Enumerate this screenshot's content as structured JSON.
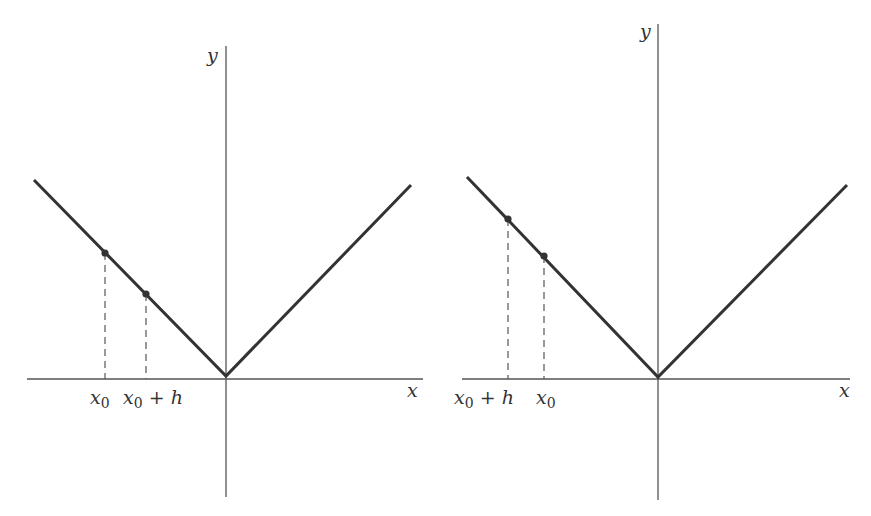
{
  "colors": {
    "background": "#ffffff",
    "axis": "#555555",
    "curve": "#333333",
    "dashed": "#555555",
    "point": "#333333",
    "label": "#333333"
  },
  "panels": [
    {
      "id": "left",
      "axis_labels": {
        "x": "x",
        "y": "y"
      },
      "axes": {
        "x_axis": {
          "x1": 27,
          "x2": 423,
          "y": 379
        },
        "y_axis": {
          "x": 226,
          "y1": 46,
          "y2": 497
        }
      },
      "curve": {
        "left_end": [
          34,
          180
        ],
        "vertex": [
          226,
          376
        ],
        "right_end": [
          411,
          185
        ]
      },
      "points": [
        {
          "name": "x0",
          "x": 105,
          "y": 253,
          "label": "x",
          "sub": "0",
          "label_x": 90,
          "suffix": ""
        },
        {
          "name": "x0-plus-h",
          "x": 146,
          "y": 294,
          "label": "x",
          "sub": "0",
          "label_x": 123,
          "suffix": "+ h"
        }
      ],
      "x_label_pos": [
        407,
        397
      ],
      "y_label_pos": [
        207,
        62
      ]
    },
    {
      "id": "right",
      "axis_labels": {
        "x": "x",
        "y": "y"
      },
      "axes": {
        "x_axis": {
          "x1": 462,
          "x2": 850,
          "y": 379
        },
        "y_axis": {
          "x": 658,
          "y1": 24,
          "y2": 500
        }
      },
      "curve": {
        "left_end": [
          467,
          177
        ],
        "vertex": [
          658,
          377
        ],
        "right_end": [
          847,
          185
        ]
      },
      "points": [
        {
          "name": "x0-plus-h",
          "x": 508,
          "y": 219,
          "label": "x",
          "sub": "0",
          "label_x": 454,
          "suffix": "+ h"
        },
        {
          "name": "x0",
          "x": 544,
          "y": 256,
          "label": "x",
          "sub": "0",
          "label_x": 536,
          "suffix": ""
        }
      ],
      "x_label_pos": [
        839,
        397
      ],
      "y_label_pos": [
        640,
        38
      ]
    }
  ],
  "text": {
    "left": {
      "x_axis_label": "x",
      "y_axis_label": "y",
      "tick_labels": [
        "x0",
        "x0 + h"
      ]
    },
    "right": {
      "x_axis_label": "x",
      "y_axis_label": "y",
      "tick_labels": [
        "x0 + h",
        "x0"
      ]
    }
  }
}
